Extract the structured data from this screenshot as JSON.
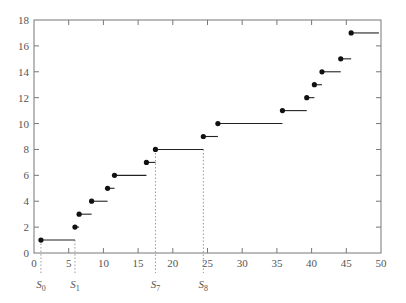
{
  "chart_data": {
    "type": "line",
    "subtype": "step-function",
    "title": "",
    "xlabel": "",
    "ylabel": "",
    "xlim": [
      0,
      50
    ],
    "ylim": [
      0,
      18
    ],
    "x_ticks": [
      0,
      5,
      10,
      15,
      20,
      25,
      30,
      35,
      40,
      45,
      50
    ],
    "y_ticks": [
      0,
      2,
      4,
      6,
      8,
      10,
      12,
      14,
      16,
      18
    ],
    "grid": false,
    "legend": null,
    "series": [
      {
        "name": "counting process",
        "steps": [
          {
            "x_start": 1.0,
            "x_end": 5.9,
            "y": 1
          },
          {
            "x_start": 5.9,
            "x_end": 6.5,
            "y": 2
          },
          {
            "x_start": 6.5,
            "x_end": 8.3,
            "y": 3
          },
          {
            "x_start": 8.3,
            "x_end": 10.6,
            "y": 4
          },
          {
            "x_start": 10.6,
            "x_end": 11.6,
            "y": 5
          },
          {
            "x_start": 11.6,
            "x_end": 16.2,
            "y": 6
          },
          {
            "x_start": 16.2,
            "x_end": 17.5,
            "y": 7
          },
          {
            "x_start": 17.5,
            "x_end": 24.4,
            "y": 8
          },
          {
            "x_start": 24.4,
            "x_end": 26.5,
            "y": 9
          },
          {
            "x_start": 26.5,
            "x_end": 35.8,
            "y": 10
          },
          {
            "x_start": 35.8,
            "x_end": 39.3,
            "y": 11
          },
          {
            "x_start": 39.3,
            "x_end": 40.4,
            "y": 12
          },
          {
            "x_start": 40.4,
            "x_end": 41.5,
            "y": 13
          },
          {
            "x_start": 41.5,
            "x_end": 44.2,
            "y": 14
          },
          {
            "x_start": 44.2,
            "x_end": 45.7,
            "y": 15
          },
          {
            "x_start": 45.7,
            "x_end": 49.7,
            "y": 17
          }
        ]
      }
    ],
    "annotations": [
      {
        "label": "S",
        "sub": "0",
        "x": 1.0,
        "y_top": 1
      },
      {
        "label": "S",
        "sub": "1",
        "x": 5.9,
        "y_top": 1
      },
      {
        "label": "S",
        "sub": "7",
        "x": 17.5,
        "y_top": 8
      },
      {
        "label": "S",
        "sub": "8",
        "x": 24.4,
        "y_top": 8
      }
    ]
  },
  "colors": {
    "axis": "#777777",
    "step": "#222222",
    "dot": "#111111",
    "dotted": "#999999",
    "text": "#555555"
  }
}
